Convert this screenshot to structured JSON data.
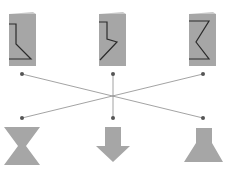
{
  "diagram": {
    "type": "matching-puzzle",
    "colors": {
      "card_fill": "#a6a6a6",
      "card_fold": "#d9d9d9",
      "cut_line": "#2b2b2b",
      "shape_fill": "#a6a6a6",
      "connector": "#8c8c8c",
      "dot": "#555555"
    },
    "cards": [
      {
        "id": "card-1",
        "cut": "step-then-diagonal"
      },
      {
        "id": "card-2",
        "cut": "lightning-zigzag"
      },
      {
        "id": "card-3",
        "cut": "chevron-zigzag"
      }
    ],
    "shapes": [
      {
        "id": "shape-1",
        "name": "hourglass"
      },
      {
        "id": "shape-2",
        "name": "down-arrow"
      },
      {
        "id": "shape-3",
        "name": "lamp-trapezoid"
      }
    ],
    "connections": [
      {
        "from": "card-1",
        "to": "shape-3"
      },
      {
        "from": "card-2",
        "to": "shape-2"
      },
      {
        "from": "card-3",
        "to": "shape-1"
      }
    ]
  }
}
